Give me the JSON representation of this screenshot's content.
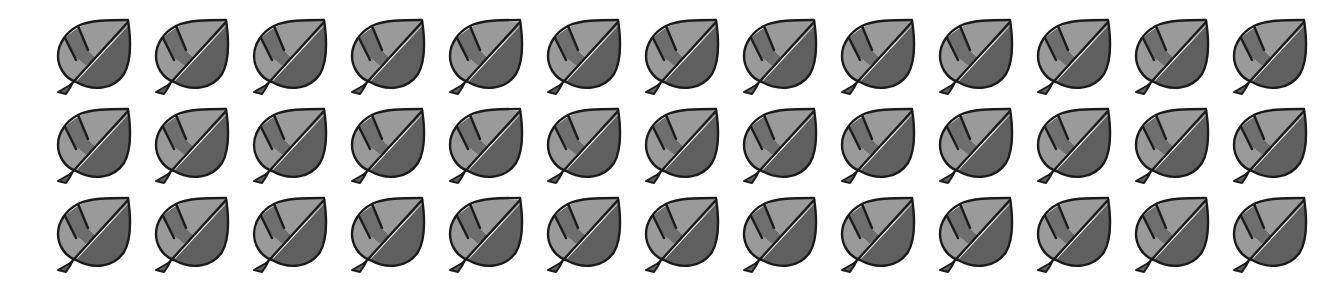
{
  "grid": {
    "rows": 3,
    "columns": 13,
    "total": 39,
    "item": {
      "icon": "leaf-icon",
      "colors": {
        "outline": "#1a1a1a",
        "light_segment": "#9a9a9a",
        "mid_segment": "#6e6e6e",
        "dark_half": "#5f5f5f",
        "background": "#ffffff"
      }
    }
  }
}
